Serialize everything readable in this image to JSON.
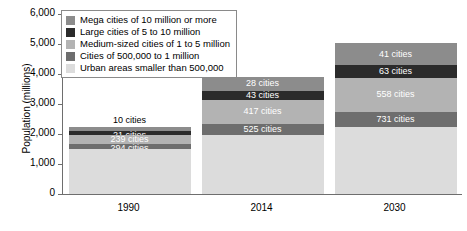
{
  "chart_data": {
    "type": "bar",
    "subtype": "stacked-vertical",
    "title": "",
    "xlabel": "",
    "ylabel": "Population (millions)",
    "ylim": [
      0,
      6000
    ],
    "ytick_values": [
      0,
      1000,
      2000,
      3000,
      4000,
      5000,
      6000
    ],
    "ytick_labels": [
      "0",
      "1,000",
      "2,000",
      "3,000",
      "4,000",
      "5,000",
      "6,000"
    ],
    "grid": false,
    "legend_position": "top-left-inside",
    "categories": [
      "1990",
      "2014",
      "2030"
    ],
    "series": [
      {
        "name": "Mega cities of 10 million or more",
        "color": "#8c8c8c",
        "values": [
          150,
          453,
          730
        ],
        "point_labels": [
          "10 cities",
          "28 cities",
          "41 cities"
        ]
      },
      {
        "name": "Large cities of 5 to 10 million",
        "color": "#2b2b2b",
        "values": [
          135,
          300,
          434
        ],
        "point_labels": [
          "21 cities",
          "43 cities",
          "63 cities"
        ]
      },
      {
        "name": "Medium-sized cities of 1 to 5 million",
        "color": "#b3b3b3",
        "values": [
          285,
          825,
          1128
        ],
        "point_labels": [
          "239 cities",
          "417 cities",
          "558 cities"
        ]
      },
      {
        "name": "Cities of 500,000 to 1 million",
        "color": "#6e6e6e",
        "values": [
          190,
          363,
          494
        ],
        "point_labels": [
          "294 cities",
          "525 cities",
          "731 cities"
        ]
      },
      {
        "name": "Urban areas smaller than 500,000",
        "color": "#dcdcdc",
        "values": [
          1490,
          1959,
          2244
        ],
        "point_labels": [
          "",
          "",
          ""
        ]
      }
    ],
    "totals": [
      2250,
      3900,
      5030
    ]
  },
  "axes": {
    "y_title": "Population (millions)",
    "y_ticks": [
      "6,000",
      "5,000",
      "4,000",
      "3,000",
      "2,000",
      "1,000",
      "0"
    ],
    "x_ticks": [
      "1990",
      "2014",
      "2030"
    ]
  },
  "legend": {
    "items": [
      {
        "label": "Mega cities of 10 million or more",
        "color": "#8c8c8c"
      },
      {
        "label": "Large cities of 5 to 10 million",
        "color": "#2b2b2b"
      },
      {
        "label": "Medium-sized cities of 1 to 5 million",
        "color": "#b3b3b3"
      },
      {
        "label": "Cities of 500,000 to 1 million",
        "color": "#6e6e6e"
      },
      {
        "label": "Urban areas smaller than 500,000",
        "color": "#dcdcdc"
      }
    ]
  },
  "bar_labels": {
    "b1990": [
      "10 cities",
      "21 cities",
      "239 cities",
      "294 cities"
    ],
    "b2014": [
      "28 cities",
      "43 cities",
      "417 cities",
      "525 cities"
    ],
    "b2030": [
      "41 cities",
      "63 cities",
      "558 cities",
      "731 cities"
    ]
  }
}
